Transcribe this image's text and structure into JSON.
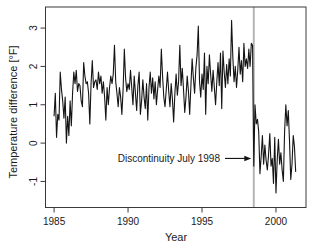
{
  "figure_title": "Temperature difference time series with discontinuity",
  "colors": {
    "background": "#ffffff",
    "box": "#3a3a3a",
    "tick": "#3a3a3a",
    "text": "#1a1a1a",
    "series_line": "#141414",
    "discontinuity_line": "#b5b5b5",
    "arrow": "#141414"
  },
  "chart_data": {
    "type": "line",
    "title": "",
    "xlabel": "Year",
    "ylabel": "Temperature difference [°F]",
    "xlim": [
      1984.42,
      2002.03
    ],
    "ylim": [
      -1.68,
      3.55
    ],
    "x_ticks": [
      1985,
      1990,
      1995,
      2000
    ],
    "y_ticks": [
      -1,
      0,
      1,
      2,
      3
    ],
    "grid": false,
    "legend": "none",
    "discontinuity_line": {
      "x": 1998.5
    },
    "annotation": {
      "text": "Discontinuity July 1998",
      "points_to_x": 1998.5,
      "points_to_y": -0.4
    },
    "series": [
      {
        "name": "temperature-difference",
        "x_start": 1985.0,
        "x_step": 0.083333,
        "values": [
          0.7,
          1.3,
          0.15,
          0.75,
          0.6,
          1.85,
          1.4,
          1.1,
          0.65,
          1.2,
          0.0,
          0.7,
          0.2,
          1.1,
          0.45,
          1.3,
          1.85,
          1.55,
          1.9,
          1.35,
          1.55,
          1.5,
          1.1,
          0.95,
          2.1,
          1.75,
          1.55,
          1.6,
          1.3,
          0.5,
          1.55,
          2.15,
          1.45,
          1.6,
          1.65,
          1.4,
          1.85,
          1.55,
          1.75,
          1.3,
          1.6,
          1.2,
          0.6,
          1.45,
          1.0,
          1.45,
          1.75,
          1.55,
          1.8,
          2.55,
          1.6,
          1.3,
          0.95,
          1.45,
          1.2,
          0.75,
          1.4,
          2.45,
          1.7,
          1.35,
          1.55,
          1.4,
          1.9,
          1.45,
          1.0,
          1.75,
          1.3,
          0.85,
          1.5,
          1.85,
          0.75,
          1.1,
          1.65,
          1.2,
          0.9,
          1.55,
          0.6,
          1.45,
          1.85,
          1.3,
          1.7,
          1.15,
          1.6,
          1.0,
          1.4,
          1.75,
          1.45,
          2.45,
          1.75,
          1.2,
          0.95,
          1.4,
          1.85,
          1.35,
          0.95,
          1.55,
          1.15,
          0.55,
          1.3,
          1.8,
          1.25,
          1.6,
          2.55,
          1.5,
          1.95,
          1.4,
          0.8,
          1.2,
          1.75,
          1.35,
          0.75,
          1.5,
          2.2,
          1.7,
          1.3,
          1.95,
          2.3,
          3.05,
          1.6,
          1.2,
          1.8,
          1.4,
          2.35,
          0.75,
          2.0,
          1.55,
          2.3,
          1.8,
          1.35,
          1.9,
          1.45,
          1.0,
          1.6,
          2.1,
          1.5,
          2.35,
          0.9,
          2.4,
          1.85,
          1.45,
          2.05,
          1.55,
          2.2,
          1.75,
          3.2,
          2.25,
          1.6,
          2.0,
          1.45,
          1.9,
          2.5,
          1.8,
          2.15,
          1.6,
          2.6,
          2.0,
          2.2,
          1.95,
          2.45,
          2.0,
          2.6,
          2.55,
          -0.6,
          1.0,
          0.5,
          0.62,
          0.3,
          -0.8,
          -0.35,
          0.2,
          -0.55,
          -0.05,
          -0.45,
          -0.7,
          -0.3,
          0.25,
          -0.6,
          -0.4,
          -1.05,
          0.15,
          -1.3,
          -0.45,
          0.1,
          -0.55,
          -0.25,
          -0.7,
          -1.0,
          0.3,
          1.0,
          0.45,
          0.85,
          0.05,
          -0.95,
          -0.55,
          0.2,
          -0.1,
          -0.75
        ]
      }
    ]
  }
}
